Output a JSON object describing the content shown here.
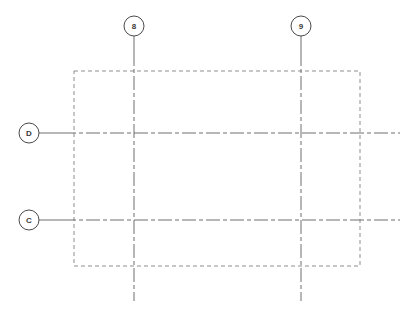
{
  "drawing": {
    "title": "Structural Grid Plan",
    "canvas": {
      "width": 412,
      "height": 314,
      "background": "#ffffff"
    },
    "styles": {
      "gridline_color": "#6f6f6f",
      "gridline_width": 1,
      "gridline_dash": "14,3,4,3",
      "outline_color": "#8d8d8d",
      "outline_width": 1,
      "outline_dash": "4,3",
      "bubble_stroke": "#4a4a4a",
      "bubble_fill": "#ffffff",
      "bubble_radius": 10,
      "leader_color": "#6f6f6f",
      "label_color": "#3a3a3a"
    },
    "column_bubbles": [
      {
        "id": "grid-bubble-8",
        "label": "8",
        "cx": 134,
        "cy": 26,
        "leader_x": 134,
        "leader_y1": 36,
        "leader_y2": 52
      },
      {
        "id": "grid-bubble-9",
        "label": "9",
        "cx": 301,
        "cy": 26,
        "leader_x": 301,
        "leader_y1": 36,
        "leader_y2": 52
      }
    ],
    "row_bubbles": [
      {
        "id": "grid-bubble-d",
        "label": "D",
        "cx": 29,
        "cy": 133,
        "leader_y": 133,
        "leader_x1": 39,
        "leader_x2": 62
      },
      {
        "id": "grid-bubble-c",
        "label": "C",
        "cx": 29,
        "cy": 220,
        "leader_y": 220,
        "leader_x1": 39,
        "leader_x2": 62
      }
    ],
    "vertical_gridlines": [
      {
        "id": "gridline-8",
        "label": "8",
        "x": 134,
        "y1": 52,
        "y2": 301
      },
      {
        "id": "gridline-9",
        "label": "9",
        "x": 301,
        "y1": 52,
        "y2": 301
      }
    ],
    "horizontal_gridlines": [
      {
        "id": "gridline-d",
        "label": "D",
        "y": 133,
        "x1": 62,
        "x2": 400
      },
      {
        "id": "gridline-c",
        "label": "C",
        "y": 220,
        "x1": 62,
        "x2": 400
      }
    ],
    "slab_outline": {
      "id": "slab-outline",
      "x": 74,
      "y": 71,
      "width": 286,
      "height": 195
    }
  }
}
